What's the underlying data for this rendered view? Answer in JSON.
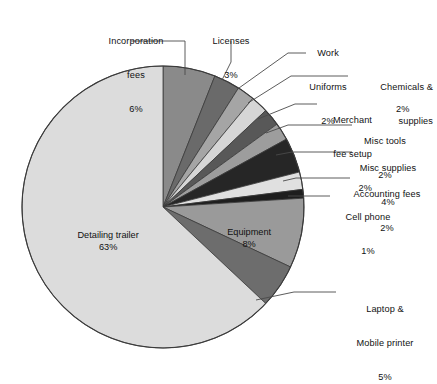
{
  "chart_data": {
    "type": "pie",
    "title": "",
    "subtitle": "",
    "xlabel": "",
    "ylabel": "",
    "legend_position": "none",
    "labels_position": "callout-and-inside",
    "grid": false,
    "units": "percent",
    "total": 100,
    "start_angle_deg": 0,
    "direction": "clockwise",
    "categories": [
      "Incorporation fees",
      "Licenses",
      "Work Uniforms",
      "Chemicals & supplies",
      "Merchant fee setup",
      "Misc tools",
      "Misc supplies",
      "Accounting fees",
      "Cell phone",
      "Equipment",
      "Laptop & Mobile printer",
      "Detailing trailer"
    ],
    "values": [
      6,
      3,
      2,
      2,
      2,
      2,
      4,
      2,
      1,
      8,
      5,
      63
    ],
    "value_labels": [
      "6%",
      "3%",
      "2%",
      "2%",
      "2%",
      "2%",
      "4%",
      "2%",
      "1%",
      "8%",
      "5%",
      "63%"
    ],
    "colors": [
      "#8f8f8f",
      "#6e6e6e",
      "#a8a8a8",
      "#d8d8d8",
      "#5a5a5a",
      "#9a9a9a",
      "#2b2b2b",
      "#7e7e7e",
      "#e2e2e2",
      "#1f1f1f",
      "#9b9b9b",
      "#8d8d8d",
      "#6b6b6b",
      "#dcdcdc"
    ],
    "slice_fills": {
      "Incorporation fees": "#8a8a8a",
      "Licenses": "#6a6a6a",
      "Work Uniforms": "#a5a5a5",
      "Chemicals & supplies": "#d6d6d6",
      "Merchant fee setup": "#585858",
      "Misc tools": "#9d9d9d",
      "Misc supplies": "#262626",
      "Accounting fees": "#e0e0e0",
      "Cell phone": "#1e1e1e",
      "Equipment": "#9a9a9a",
      "Laptop & Mobile printer": "#6d6d6d",
      "Detailing trailer": "#dcdcdc"
    },
    "outline_color": "#3a3a3a",
    "background": "#ffffff"
  },
  "pie": {
    "center_x": 163,
    "center_y": 207,
    "radius": 141
  },
  "labels": {
    "incorporation_fees": {
      "name": "Incorporation",
      "name2": "fees",
      "pct": "6%"
    },
    "licenses": {
      "name": "Licenses",
      "pct": "3%"
    },
    "work_uniforms": {
      "name": "Work",
      "name2": "Uniforms",
      "pct": "2%"
    },
    "chemicals_supplies": {
      "name": "Chemicals &",
      "name2": "supplies",
      "pct": "2%"
    },
    "merchant_fee_setup": {
      "name": "Merchant",
      "name2": "fee setup",
      "pct": "2%"
    },
    "misc_tools": {
      "name": "Misc tools",
      "pct": "2%"
    },
    "misc_supplies": {
      "name": "Misc supplies",
      "pct": "4%"
    },
    "accounting_fees": {
      "name": "Accounting fees",
      "pct": "2%"
    },
    "cell_phone": {
      "name": "Cell phone",
      "pct": "1%"
    },
    "equipment": {
      "name": "Equipment",
      "pct": "8%"
    },
    "laptop_printer": {
      "name": "Laptop &",
      "name2": "Mobile printer",
      "pct": "5%"
    },
    "detailing_trailer": {
      "name": "Detailing trailer",
      "pct": "63%"
    }
  }
}
